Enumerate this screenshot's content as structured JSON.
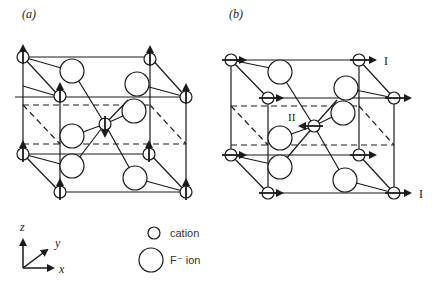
{
  "figure": {
    "panel_a": {
      "label": "(a)"
    },
    "panel_b": {
      "label": "(b)",
      "mode_labels": {
        "I_top": "I",
        "I_bottom": "I",
        "II": "II"
      }
    },
    "axes": {
      "z": "z",
      "y": "y",
      "x": "x"
    },
    "legend": {
      "items": [
        {
          "symbol": "small-circle",
          "label": "cation"
        },
        {
          "symbol": "large-circle",
          "label": "F⁻ ion"
        }
      ]
    },
    "colors": {
      "line": "#1a1a1a",
      "background": "#ffffff"
    }
  }
}
